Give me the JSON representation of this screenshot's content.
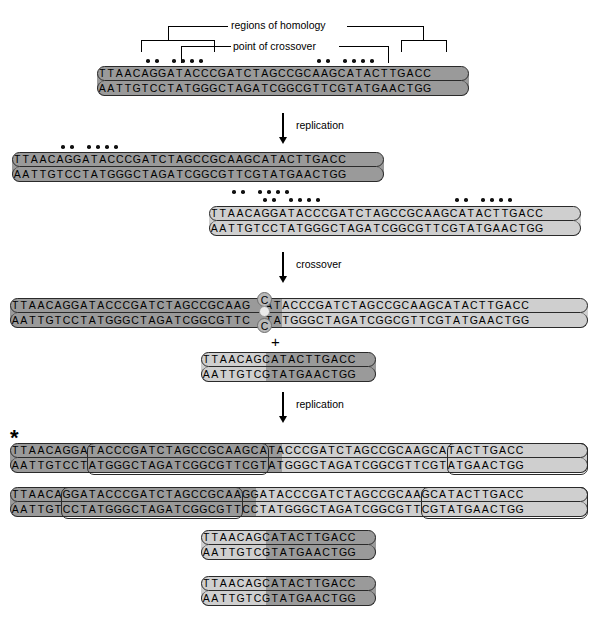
{
  "figure": {
    "labels": {
      "regions_of_homology": "regions of homology",
      "point_of_crossover": "point of crossover",
      "replication_1": "replication",
      "crossover": "crossover",
      "replication_2": "replication",
      "plus": "+",
      "asterisk": "*"
    },
    "colors": {
      "dark_strand": "#9a9a9a",
      "light_strand": "#cfcfcf",
      "outline": "#2a2a2a",
      "dot": "#111111",
      "background": "#ffffff"
    }
  },
  "sequences": {
    "parent": {
      "top": "TTAACAGGATACCCGATCTAGCCGCAAGCATACTTGACC",
      "bottom": "AATTGTCCTATGGGCTAGATCGGCGTTCGTATGAACTGG",
      "shade": "dark"
    },
    "replicated_a": {
      "top": "TTAACAGGATACCCGATCTAGCCGCAAGCATACTTGACC",
      "bottom": "AATTGTCCTATGGGCTAGATCGGCGTTCGTATGAACTGG",
      "shade": "dark"
    },
    "replicated_b": {
      "top": "TTAACAGGATACCCGATCTAGCCGCAAGCATACTTGACC",
      "bottom": "AATTGTCCTATGGGCTAGATCGGCGTTCGTATGAACTGG",
      "shade": "light"
    },
    "crossover_product_long": {
      "left_top": "TTAACAGGATACCCGATCTAGCCGCAAG",
      "left_bottom": "AATTGTCCTATGGGCTAGATCGGCGTTC",
      "bubble_top": "C",
      "bubble_bottom": "C",
      "right_top": "ATACCCGATCTAGCCGCAAGCATACTTGACC",
      "right_bottom": "TATGGGCTAGATCGGCGTTCGTATGAACTGG",
      "left_shade": "dark",
      "right_shade": "light"
    },
    "crossover_product_short": {
      "top": "TTAACAGCATACTTGACC",
      "bottom": "AATTGTCGTATGAACTGG",
      "split_index": 7,
      "left_shade": "light",
      "right_shade": "dark"
    },
    "final_long_1": {
      "top_blocks": [
        "TTAACAGGA",
        "TACCCGATCTAGCCGCAAGCA",
        "TACCCGATCTAGCCGCAAGCA",
        "TACTTGACC"
      ],
      "bottom_blocks": [
        "AATTGTCCT",
        "ATGGGCTAGATCGGCGTTCGT",
        "ATGGGCTAGATCGGCGTTCGT",
        "ATGAACTGG"
      ],
      "shade_split_index": 30,
      "left_shade": "dark",
      "right_shade": "light"
    },
    "final_long_2": {
      "top_blocks": [
        "TTAACA",
        "GGATACCCGATCTAGCCGCAA",
        "GGATACCCGATCTAGCCGCAA",
        "GCATACTTGACC"
      ],
      "bottom_blocks": [
        "AATTGT",
        "CCTATGGGCTAGATCGGCGTT",
        "CCTATGGGCTAGATCGGCGTT",
        "CGTATGAACTGG"
      ],
      "shade_split_index": 27,
      "left_shade": "dark",
      "right_shade": "light"
    },
    "final_short_1": {
      "top": "TTAACAGCATACTTGACC",
      "bottom": "AATTGTCGTATGAACTGG",
      "split_index": 7,
      "left_shade": "light",
      "right_shade": "dark"
    },
    "final_short_2": {
      "top": "TTAACAGCATACTTGACC",
      "bottom": "AATTGTCGTATGAACTGG",
      "split_index": 7,
      "left_shade": "light",
      "right_shade": "dark"
    }
  },
  "dot_groups": {
    "parent_left": [
      5,
      6,
      9,
      10,
      11,
      12
    ],
    "parent_right": [
      25,
      26,
      29,
      30,
      31,
      32
    ],
    "repA_left": [
      5,
      6,
      9,
      10,
      11,
      12
    ],
    "repA_right": [
      25,
      26,
      29,
      30,
      31,
      32
    ],
    "repB_left": [
      5,
      6,
      9,
      10,
      11,
      12
    ],
    "repB_right": [
      25,
      26,
      29,
      30,
      31,
      32
    ]
  }
}
